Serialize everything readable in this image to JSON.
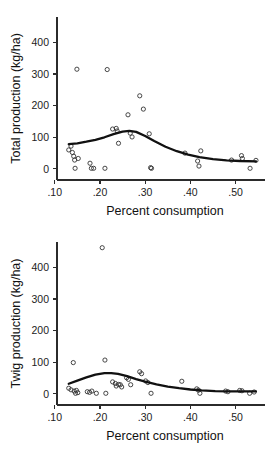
{
  "figure": {
    "background": "#ffffff",
    "point_color": "#333333",
    "curve_color": "#111111",
    "axis_color": "#2b2b2b"
  },
  "chart_data": [
    {
      "type": "scatter",
      "id": "total-production",
      "title": "",
      "xlabel": "Percent consumption",
      "ylabel": "Total production (kg/ha)",
      "xlim": [
        0.105,
        0.565
      ],
      "ylim": [
        -35,
        480
      ],
      "xticks": [
        0.1,
        0.2,
        0.3,
        0.4,
        0.5
      ],
      "xticklabels": [
        ".10",
        ".20",
        ".30",
        ".40",
        ".50"
      ],
      "yticks": [
        0,
        100,
        200,
        300,
        400
      ],
      "yticklabels": [
        "0",
        "100",
        "200",
        "300",
        "400"
      ],
      "grid": false,
      "legend": "none",
      "marker": "open-circle",
      "points": [
        {
          "x": 0.131,
          "y": 60
        },
        {
          "x": 0.136,
          "y": 72
        },
        {
          "x": 0.139,
          "y": 52
        },
        {
          "x": 0.142,
          "y": 40
        },
        {
          "x": 0.144,
          "y": 28
        },
        {
          "x": 0.145,
          "y": 2
        },
        {
          "x": 0.149,
          "y": 315
        },
        {
          "x": 0.152,
          "y": 33
        },
        {
          "x": 0.178,
          "y": 18
        },
        {
          "x": 0.181,
          "y": 2
        },
        {
          "x": 0.186,
          "y": 2
        },
        {
          "x": 0.211,
          "y": 2
        },
        {
          "x": 0.216,
          "y": 314
        },
        {
          "x": 0.228,
          "y": 126
        },
        {
          "x": 0.236,
          "y": 128
        },
        {
          "x": 0.238,
          "y": 120
        },
        {
          "x": 0.241,
          "y": 81
        },
        {
          "x": 0.262,
          "y": 171
        },
        {
          "x": 0.267,
          "y": 113
        },
        {
          "x": 0.271,
          "y": 101
        },
        {
          "x": 0.288,
          "y": 231
        },
        {
          "x": 0.296,
          "y": 189
        },
        {
          "x": 0.309,
          "y": 111
        },
        {
          "x": 0.312,
          "y": 4
        },
        {
          "x": 0.314,
          "y": 2
        },
        {
          "x": 0.388,
          "y": 50
        },
        {
          "x": 0.416,
          "y": 25
        },
        {
          "x": 0.419,
          "y": 9
        },
        {
          "x": 0.423,
          "y": 57
        },
        {
          "x": 0.491,
          "y": 28
        },
        {
          "x": 0.513,
          "y": 42
        },
        {
          "x": 0.515,
          "y": 33
        },
        {
          "x": 0.532,
          "y": 2
        },
        {
          "x": 0.545,
          "y": 27
        }
      ],
      "fit_curve": [
        {
          "x": 0.131,
          "y": 78
        },
        {
          "x": 0.15,
          "y": 81
        },
        {
          "x": 0.17,
          "y": 86
        },
        {
          "x": 0.19,
          "y": 92
        },
        {
          "x": 0.21,
          "y": 100
        },
        {
          "x": 0.23,
          "y": 110
        },
        {
          "x": 0.25,
          "y": 118
        },
        {
          "x": 0.265,
          "y": 120
        },
        {
          "x": 0.28,
          "y": 117
        },
        {
          "x": 0.3,
          "y": 104
        },
        {
          "x": 0.32,
          "y": 88
        },
        {
          "x": 0.345,
          "y": 70
        },
        {
          "x": 0.37,
          "y": 56
        },
        {
          "x": 0.395,
          "y": 45
        },
        {
          "x": 0.42,
          "y": 37
        },
        {
          "x": 0.45,
          "y": 31
        },
        {
          "x": 0.48,
          "y": 27
        },
        {
          "x": 0.51,
          "y": 25
        },
        {
          "x": 0.545,
          "y": 24
        }
      ]
    },
    {
      "type": "scatter",
      "id": "twig-production",
      "title": "",
      "xlabel": "Percent consumption",
      "ylabel": "Twig production (kg/ha)",
      "xlim": [
        0.105,
        0.565
      ],
      "ylim": [
        -35,
        480
      ],
      "xticks": [
        0.1,
        0.2,
        0.3,
        0.4,
        0.5
      ],
      "xticklabels": [
        ".10",
        ".20",
        ".30",
        ".40",
        ".50"
      ],
      "yticks": [
        0,
        100,
        200,
        300,
        400
      ],
      "yticklabels": [
        "0",
        "100",
        "200",
        "300",
        "400"
      ],
      "grid": false,
      "legend": "none",
      "marker": "open-circle",
      "points": [
        {
          "x": 0.131,
          "y": 18
        },
        {
          "x": 0.136,
          "y": 13
        },
        {
          "x": 0.141,
          "y": 99
        },
        {
          "x": 0.143,
          "y": 9
        },
        {
          "x": 0.146,
          "y": 2
        },
        {
          "x": 0.148,
          "y": 11
        },
        {
          "x": 0.151,
          "y": 4
        },
        {
          "x": 0.172,
          "y": 7
        },
        {
          "x": 0.177,
          "y": 5
        },
        {
          "x": 0.182,
          "y": 9
        },
        {
          "x": 0.192,
          "y": 2
        },
        {
          "x": 0.205,
          "y": 462
        },
        {
          "x": 0.211,
          "y": 107
        },
        {
          "x": 0.213,
          "y": 2
        },
        {
          "x": 0.228,
          "y": 38
        },
        {
          "x": 0.234,
          "y": 33
        },
        {
          "x": 0.236,
          "y": 25
        },
        {
          "x": 0.241,
          "y": 30
        },
        {
          "x": 0.245,
          "y": 29
        },
        {
          "x": 0.248,
          "y": 22
        },
        {
          "x": 0.259,
          "y": 51
        },
        {
          "x": 0.263,
          "y": 46
        },
        {
          "x": 0.268,
          "y": 29
        },
        {
          "x": 0.288,
          "y": 70
        },
        {
          "x": 0.292,
          "y": 64
        },
        {
          "x": 0.301,
          "y": 41
        },
        {
          "x": 0.306,
          "y": 36
        },
        {
          "x": 0.313,
          "y": 2
        },
        {
          "x": 0.381,
          "y": 40
        },
        {
          "x": 0.414,
          "y": 16
        },
        {
          "x": 0.418,
          "y": 12
        },
        {
          "x": 0.421,
          "y": 2
        },
        {
          "x": 0.478,
          "y": 9
        },
        {
          "x": 0.483,
          "y": 7
        },
        {
          "x": 0.509,
          "y": 11
        },
        {
          "x": 0.514,
          "y": 10
        },
        {
          "x": 0.531,
          "y": 2
        },
        {
          "x": 0.541,
          "y": 6
        }
      ],
      "fit_curve": [
        {
          "x": 0.131,
          "y": 32
        },
        {
          "x": 0.15,
          "y": 42
        },
        {
          "x": 0.17,
          "y": 52
        },
        {
          "x": 0.19,
          "y": 61
        },
        {
          "x": 0.21,
          "y": 66
        },
        {
          "x": 0.225,
          "y": 66
        },
        {
          "x": 0.24,
          "y": 63
        },
        {
          "x": 0.26,
          "y": 56
        },
        {
          "x": 0.28,
          "y": 47
        },
        {
          "x": 0.3,
          "y": 39
        },
        {
          "x": 0.325,
          "y": 30
        },
        {
          "x": 0.35,
          "y": 23
        },
        {
          "x": 0.375,
          "y": 18
        },
        {
          "x": 0.4,
          "y": 14
        },
        {
          "x": 0.425,
          "y": 11
        },
        {
          "x": 0.455,
          "y": 9
        },
        {
          "x": 0.485,
          "y": 8
        },
        {
          "x": 0.515,
          "y": 8
        },
        {
          "x": 0.545,
          "y": 8
        }
      ]
    }
  ]
}
